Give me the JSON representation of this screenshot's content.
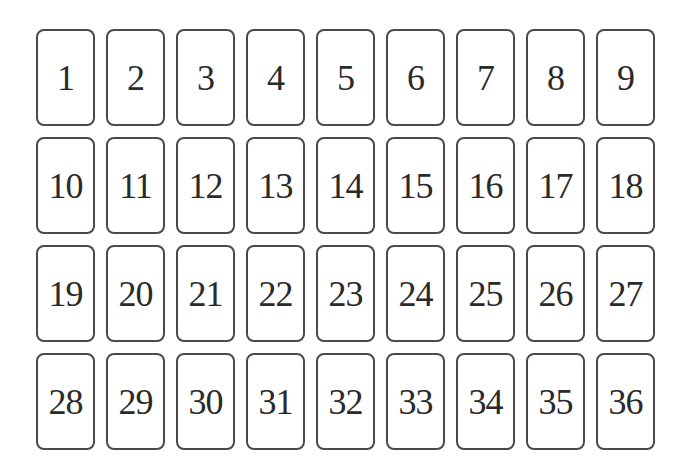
{
  "board": {
    "rows": 4,
    "columns": 9,
    "cards": [
      {
        "label": "1"
      },
      {
        "label": "2"
      },
      {
        "label": "3"
      },
      {
        "label": "4"
      },
      {
        "label": "5"
      },
      {
        "label": "6"
      },
      {
        "label": "7"
      },
      {
        "label": "8"
      },
      {
        "label": "9"
      },
      {
        "label": "10"
      },
      {
        "label": "11"
      },
      {
        "label": "12"
      },
      {
        "label": "13"
      },
      {
        "label": "14"
      },
      {
        "label": "15"
      },
      {
        "label": "16"
      },
      {
        "label": "17"
      },
      {
        "label": "18"
      },
      {
        "label": "19"
      },
      {
        "label": "20"
      },
      {
        "label": "21"
      },
      {
        "label": "22"
      },
      {
        "label": "23"
      },
      {
        "label": "24"
      },
      {
        "label": "25"
      },
      {
        "label": "26"
      },
      {
        "label": "27"
      },
      {
        "label": "28"
      },
      {
        "label": "29"
      },
      {
        "label": "30"
      },
      {
        "label": "31"
      },
      {
        "label": "32"
      },
      {
        "label": "33"
      },
      {
        "label": "34"
      },
      {
        "label": "35"
      },
      {
        "label": "36"
      }
    ]
  }
}
